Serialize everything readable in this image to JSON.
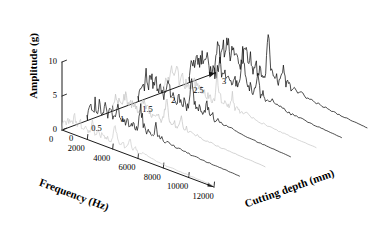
{
  "chart_data": {
    "type": "line",
    "subtype": "3d-waterfall-spectrum",
    "title": "",
    "xlabel": "Frequency (Hz)",
    "ylabel": "Amplitude (g)",
    "zlabel": "Cutting depth (mm)",
    "xlim": [
      0,
      12000
    ],
    "ylim": [
      0,
      10
    ],
    "zlim": [
      0,
      3
    ],
    "xticks": [
      "0",
      "2000",
      "4000",
      "6000",
      "8000",
      "10000",
      "12000"
    ],
    "yticks": [
      "0",
      "5",
      "10"
    ],
    "zticks": [
      "0",
      "0.5",
      "1",
      "1.5",
      "2",
      "2.5",
      "3"
    ],
    "grid": false,
    "legend": false,
    "colors": {
      "dark_trace": "#151515",
      "light_trace": "#bdbdbd",
      "axis": "#1a1a1a",
      "background": "#ffffff"
    },
    "x": [
      0,
      200,
      400,
      600,
      800,
      1000,
      1200,
      1400,
      1600,
      1800,
      2000,
      2200,
      2400,
      2600,
      2800,
      3000,
      3200,
      3400,
      3600,
      3800,
      4000,
      4200,
      4400,
      4600,
      4800,
      5000,
      5200,
      5400,
      5600,
      5800,
      6000,
      6400,
      6800,
      7200,
      7600,
      8000,
      8600,
      9200,
      9800,
      10400,
      11000,
      11600,
      12000
    ],
    "series": [
      {
        "name": "depth 0.0 mm",
        "z": 0,
        "color": "#cfcfcf",
        "values": [
          0.5,
          1.8,
          1.2,
          2.3,
          1.5,
          2.6,
          1.7,
          2.2,
          1.3,
          1.9,
          1.1,
          1.6,
          2.4,
          1.4,
          2.0,
          1.2,
          1.7,
          1.0,
          1.5,
          0.9,
          1.3,
          3.6,
          1.8,
          1.1,
          1.4,
          0.9,
          1.2,
          2.2,
          1.0,
          1.3,
          0.8,
          1.0,
          0.8,
          0.7,
          0.6,
          0.5,
          0.45,
          0.4,
          0.35,
          0.3,
          0.25,
          0.2,
          0.15
        ]
      },
      {
        "name": "depth 0.5 mm",
        "z": 0.5,
        "color": "#1a1a1a",
        "values": [
          0.6,
          2.4,
          1.6,
          3.0,
          2.0,
          3.4,
          2.1,
          2.9,
          1.8,
          2.5,
          1.5,
          2.1,
          3.1,
          1.9,
          2.6,
          1.6,
          2.2,
          1.4,
          2.0,
          1.2,
          1.8,
          5.2,
          2.4,
          1.5,
          1.9,
          1.2,
          1.6,
          3.0,
          1.4,
          1.8,
          1.1,
          1.3,
          1.0,
          0.9,
          0.8,
          0.7,
          0.6,
          0.5,
          0.45,
          0.4,
          0.32,
          0.25,
          0.2
        ]
      },
      {
        "name": "depth 1.0 mm",
        "z": 1.0,
        "color": "#c4c4c4",
        "values": [
          0.7,
          2.1,
          1.5,
          2.7,
          1.9,
          3.1,
          2.0,
          2.6,
          1.7,
          2.3,
          1.4,
          2.0,
          2.9,
          1.8,
          2.5,
          1.5,
          2.1,
          1.3,
          1.9,
          1.2,
          1.7,
          4.7,
          2.3,
          1.4,
          1.8,
          1.1,
          1.5,
          2.8,
          1.3,
          1.7,
          1.0,
          1.2,
          0.95,
          0.85,
          0.75,
          0.65,
          0.55,
          0.48,
          0.42,
          0.36,
          0.3,
          0.24,
          0.18
        ]
      },
      {
        "name": "depth 1.5 mm",
        "z": 1.5,
        "color": "#151515",
        "values": [
          0.8,
          3.2,
          2.2,
          4.1,
          2.7,
          4.6,
          2.9,
          3.9,
          2.4,
          3.3,
          2.0,
          2.8,
          4.2,
          2.5,
          3.5,
          2.1,
          3.0,
          1.9,
          2.6,
          1.6,
          2.4,
          7.0,
          3.2,
          2.0,
          2.5,
          1.6,
          2.1,
          4.0,
          1.8,
          2.4,
          1.4,
          1.7,
          1.3,
          1.15,
          1.0,
          0.9,
          0.78,
          0.66,
          0.56,
          0.48,
          0.4,
          0.32,
          0.25
        ]
      },
      {
        "name": "depth 2.0 mm",
        "z": 2.0,
        "color": "#c9c9c9",
        "values": [
          0.7,
          2.6,
          1.8,
          3.3,
          2.2,
          3.8,
          2.4,
          3.2,
          2.0,
          2.7,
          1.7,
          2.3,
          3.5,
          2.1,
          2.9,
          1.8,
          2.5,
          1.6,
          2.2,
          1.4,
          2.0,
          5.8,
          2.7,
          1.7,
          2.1,
          1.35,
          1.8,
          3.3,
          1.55,
          2.0,
          1.2,
          1.45,
          1.1,
          0.98,
          0.86,
          0.76,
          0.65,
          0.55,
          0.47,
          0.4,
          0.33,
          0.27,
          0.21
        ]
      },
      {
        "name": "depth 2.5 mm",
        "z": 2.5,
        "color": "#131313",
        "values": [
          0.9,
          3.6,
          2.5,
          4.6,
          3.0,
          5.2,
          3.3,
          4.4,
          2.7,
          3.7,
          2.3,
          3.2,
          4.8,
          2.9,
          4.0,
          2.4,
          3.4,
          2.1,
          3.0,
          1.9,
          2.7,
          8.0,
          3.6,
          2.3,
          2.9,
          1.85,
          2.4,
          4.6,
          2.1,
          2.7,
          1.6,
          1.95,
          1.5,
          1.32,
          1.15,
          1.0,
          0.88,
          0.75,
          0.64,
          0.55,
          0.45,
          0.36,
          0.28
        ]
      },
      {
        "name": "depth 3.0 mm",
        "z": 3.0,
        "color": "#101010",
        "values": [
          1.0,
          4.0,
          2.8,
          5.1,
          3.4,
          5.8,
          3.7,
          4.9,
          3.0,
          4.1,
          2.6,
          3.6,
          5.4,
          3.2,
          4.5,
          2.7,
          3.8,
          2.4,
          3.3,
          2.1,
          3.0,
          9.0,
          4.0,
          2.6,
          3.2,
          2.1,
          2.7,
          5.1,
          2.3,
          3.0,
          1.8,
          2.2,
          1.7,
          1.5,
          1.3,
          1.15,
          1.0,
          0.85,
          0.72,
          0.62,
          0.5,
          0.4,
          0.32
        ]
      }
    ]
  }
}
